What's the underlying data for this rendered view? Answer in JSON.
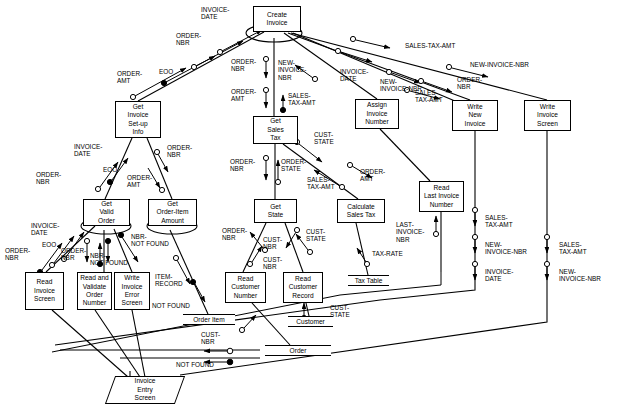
{
  "diagram": {
    "type": "structure-chart",
    "stroke_color": "#000000",
    "background_color": "#ffffff"
  },
  "modules": [
    {
      "id": "create-invoice",
      "label": "Create\nInvoice",
      "x": 253,
      "y": 6,
      "w": 48,
      "h": 26,
      "iteration": true
    },
    {
      "id": "get-invoice-setup-info",
      "label": "Get\nInvoice\nSet-up\nInfo",
      "x": 115,
      "y": 101,
      "w": 46,
      "h": 37,
      "iteration": false
    },
    {
      "id": "get-sales-tax",
      "label": "Get\nSales\nTax",
      "x": 253,
      "y": 116,
      "w": 45,
      "h": 28,
      "iteration": false
    },
    {
      "id": "assign-invoice-number",
      "label": "Assign\nInvoice\nNumber",
      "x": 355,
      "y": 99,
      "w": 44,
      "h": 30,
      "iteration": false
    },
    {
      "id": "write-new-invoice",
      "label": "Write\nNew\nInvoice",
      "x": 452,
      "y": 100,
      "w": 46,
      "h": 31,
      "iteration": false
    },
    {
      "id": "write-invoice-screen",
      "label": "Write\nInvoice\nScreen",
      "x": 524,
      "y": 100,
      "w": 47,
      "h": 31,
      "iteration": false
    },
    {
      "id": "get-valid-order",
      "label": "Get\nValid\nOrder",
      "x": 83,
      "y": 199,
      "w": 47,
      "h": 27,
      "iteration": true
    },
    {
      "id": "get-order-item-amount",
      "label": "Get\nOrder-Item\nAmount",
      "x": 148,
      "y": 199,
      "w": 49,
      "h": 27,
      "iteration": true
    },
    {
      "id": "get-state",
      "label": "Get\nState",
      "x": 254,
      "y": 199,
      "w": 43,
      "h": 24,
      "iteration": false
    },
    {
      "id": "calculate-sales-tax",
      "label": "Calculate\nSales Tax",
      "x": 337,
      "y": 199,
      "w": 48,
      "h": 24,
      "iteration": false
    },
    {
      "id": "read-last-invoice-number",
      "label": "Read\nLast Invoice\nNumber",
      "x": 419,
      "y": 181,
      "w": 45,
      "h": 31,
      "iteration": false
    },
    {
      "id": "read-invoice-screen",
      "label": "Read\nInvoice\nScreen",
      "x": 25,
      "y": 272,
      "w": 39,
      "h": 38,
      "iteration": false
    },
    {
      "id": "read-and-validate-order-number",
      "label": "Read and\nValidate\nOrder\nNumber",
      "x": 77,
      "y": 272,
      "w": 35,
      "h": 38,
      "iteration": false
    },
    {
      "id": "write-invoice-error-screen",
      "label": "Write\nInvoice\nError\nScreen",
      "x": 114,
      "y": 272,
      "w": 36,
      "h": 38,
      "iteration": false
    },
    {
      "id": "read-customer-number",
      "label": "Read\nCustomer\nNumber",
      "x": 225,
      "y": 272,
      "w": 41,
      "h": 31,
      "iteration": false
    },
    {
      "id": "read-customer-record",
      "label": "Read\nCustomer\nRecord",
      "x": 283,
      "y": 272,
      "w": 40,
      "h": 31,
      "iteration": false
    }
  ],
  "datastores": [
    {
      "id": "order-item",
      "label": "Order Item",
      "x": 183,
      "y": 314,
      "w": 52
    },
    {
      "id": "tax-table",
      "label": "Tax Table",
      "x": 348,
      "y": 275,
      "w": 41
    },
    {
      "id": "customer",
      "label": "Customer",
      "x": 288,
      "y": 316,
      "w": 45
    },
    {
      "id": "order",
      "label": "Order",
      "x": 265,
      "y": 345,
      "w": 66
    }
  ],
  "screens": [
    {
      "id": "invoice-entry-screen",
      "label": "Invoice\nEntry\nScreen",
      "x": 110,
      "y": 376,
      "w": 70,
      "h": 28
    }
  ],
  "flow_labels": [
    {
      "id": "lbl-invoice-date-top",
      "text": "INVOICE-\nDATE",
      "x": 201,
      "y": 6
    },
    {
      "id": "lbl-order-nbr-top",
      "text": "ORDER-\nNBR",
      "x": 176,
      "y": 32
    },
    {
      "id": "lbl-eoo-top",
      "text": "EOO",
      "x": 159,
      "y": 68
    },
    {
      "id": "lbl-order-amt-top",
      "text": "ORDER-\nAMT",
      "x": 117,
      "y": 70
    },
    {
      "id": "lbl-order-nbr-ci-left",
      "text": "ORDER-\nNBR",
      "x": 231,
      "y": 58
    },
    {
      "id": "lbl-order-amt-ci-left",
      "text": "ORDER-\nAMT",
      "x": 231,
      "y": 88
    },
    {
      "id": "lbl-new-invoice-nbr-ci",
      "text": "NEW-\nINVOICE-\nNBR",
      "x": 278,
      "y": 59
    },
    {
      "id": "lbl-sales-tax-amt-ci",
      "text": "SALES-\nTAX-AMT",
      "x": 288,
      "y": 92
    },
    {
      "id": "lbl-sales-tax-amt-long",
      "text": "SALES-TAX-AMT",
      "x": 405,
      "y": 42
    },
    {
      "id": "lbl-new-invoice-nbr-long",
      "text": "NEW-INVOICE-NBR",
      "x": 470,
      "y": 61
    },
    {
      "id": "lbl-invoice-date-assign",
      "text": "INVOICE-\nDATE",
      "x": 340,
      "y": 68
    },
    {
      "id": "lbl-new-invoice-nbr-write",
      "text": "NEW-\nINVOICE-NBR",
      "x": 380,
      "y": 78
    },
    {
      "id": "lbl-sales-tax-amt-write",
      "text": "SALES-\nTAX-AMT",
      "x": 415,
      "y": 89
    },
    {
      "id": "lbl-order-nbr-write",
      "text": "ORDER-\nNBR",
      "x": 457,
      "y": 76
    },
    {
      "id": "lbl-invoice-date-gisi",
      "text": "INVOICE-\nDATE",
      "x": 74,
      "y": 143
    },
    {
      "id": "lbl-order-nbr-gisi-right",
      "text": "ORDER-\nNBR",
      "x": 167,
      "y": 144
    },
    {
      "id": "lbl-order-nbr-gisi-left",
      "text": "ORDER-\nNBR",
      "x": 36,
      "y": 171
    },
    {
      "id": "lbl-eoo-gisi",
      "text": "EOO",
      "x": 103,
      "y": 166
    },
    {
      "id": "lbl-order-amt-gisi",
      "text": "ORDER-\nAMT",
      "x": 127,
      "y": 174
    },
    {
      "id": "lbl-invoice-date-gvo",
      "text": "INVOICE-\nDATE",
      "x": 31,
      "y": 222
    },
    {
      "id": "lbl-eoo-gvo",
      "text": "EOO",
      "x": 42,
      "y": 241
    },
    {
      "id": "lbl-order-nbr-gvo-left",
      "text": "ORDER-\nNBR",
      "x": 5,
      "y": 247
    },
    {
      "id": "lbl-order-nbr-gvo-right",
      "text": "ORDER-\nNBR",
      "x": 61,
      "y": 247
    },
    {
      "id": "lbl-nbr-not-found-gvo",
      "text": "NBR-\nNOT FOUND",
      "x": 90,
      "y": 252
    },
    {
      "id": "lbl-nbr-not-found-goia",
      "text": "NBR-\nNOT FOUND",
      "x": 131,
      "y": 233
    },
    {
      "id": "lbl-item-record",
      "text": "ITEM-\nRECORD",
      "x": 155,
      "y": 273
    },
    {
      "id": "lbl-not-found-item",
      "text": "NOT FOUND",
      "x": 152,
      "y": 302
    },
    {
      "id": "lbl-order-nbr-gst",
      "text": "ORDER-\nNBR",
      "x": 230,
      "y": 158
    },
    {
      "id": "lbl-order-state-gst",
      "text": "ORDER-\nSTATE",
      "x": 281,
      "y": 158
    },
    {
      "id": "lbl-sales-tax-amt-gst",
      "text": "SALES-\nTAX-AMT",
      "x": 307,
      "y": 176
    },
    {
      "id": "lbl-cust-state-gst",
      "text": "CUST-\nSTATE",
      "x": 314,
      "y": 131
    },
    {
      "id": "lbl-order-amt-calc",
      "text": "ORDER-\nAMT",
      "x": 360,
      "y": 168
    },
    {
      "id": "lbl-order-nbr-getstate",
      "text": "ORDER-\nNBR",
      "x": 222,
      "y": 227
    },
    {
      "id": "lbl-cust-nbr-getstate",
      "text": "CUST-\nNBR",
      "x": 263,
      "y": 236
    },
    {
      "id": "lbl-cust-nbr-getstate2",
      "text": "CUST-\nNBR",
      "x": 263,
      "y": 256
    },
    {
      "id": "lbl-cust-state-rcr",
      "text": "CUST-\nSTATE",
      "x": 306,
      "y": 228
    },
    {
      "id": "lbl-cust-nbr-order",
      "text": "CUST-\nNBR",
      "x": 201,
      "y": 331
    },
    {
      "id": "lbl-cust-state-cust",
      "text": "CUST-\nSTATE",
      "x": 330,
      "y": 304
    },
    {
      "id": "lbl-tax-rate",
      "text": "TAX-RATE",
      "x": 372,
      "y": 250
    },
    {
      "id": "lbl-last-invoice-nbr",
      "text": "LAST-\nINVOICE-\nNBR",
      "x": 396,
      "y": 221
    },
    {
      "id": "lbl-sales-tax-amt-wni",
      "text": "SALES-\nTAX-AMT",
      "x": 485,
      "y": 214
    },
    {
      "id": "lbl-new-invoice-nbr-wni",
      "text": "NEW-\nINVOICE-NBR",
      "x": 485,
      "y": 241
    },
    {
      "id": "lbl-invoice-date-wni",
      "text": "INVOICE-\nDATE",
      "x": 485,
      "y": 268
    },
    {
      "id": "lbl-sales-tax-amt-wis",
      "text": "SALES-\nTAX-AMT",
      "x": 559,
      "y": 241
    },
    {
      "id": "lbl-new-invoice-nbr-wis",
      "text": "NEW-\nINVOICE-NBR",
      "x": 559,
      "y": 268
    },
    {
      "id": "lbl-not-found-bottom",
      "text": "NOT FOUND",
      "x": 176,
      "y": 361
    }
  ]
}
